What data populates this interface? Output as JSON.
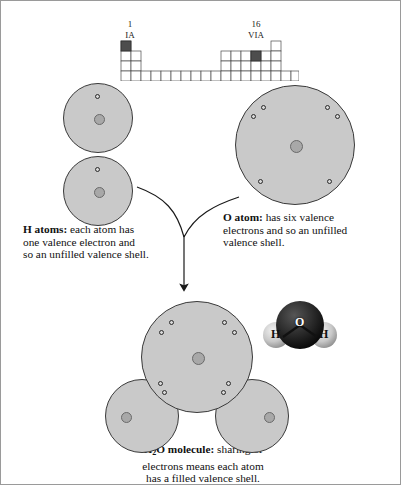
{
  "figure": {
    "background_color": "#ffffff",
    "border_color": "#9a9a9a"
  },
  "periodic_table": {
    "group_1": {
      "number": "1",
      "roman": "IA"
    },
    "group_16": {
      "number": "16",
      "roman": "VIA"
    },
    "highlight_color": "#4d4d4d",
    "cell_fill": "#ffffff",
    "cell_stroke": "#4a4a4a"
  },
  "atoms": {
    "hydrogen_1": {
      "label": "H",
      "valence_electrons": 1
    },
    "hydrogen_2": {
      "label": "H",
      "valence_electrons": 1
    },
    "oxygen": {
      "label": "O",
      "valence_electrons": 6
    },
    "shell_color": "#c9c9c9",
    "shell_stroke": "#3a3a3a",
    "nucleus_color": "#a8a8a8",
    "electron_color": "#d8d8d8",
    "electron_stroke": "#2a2a2a"
  },
  "captions": {
    "h_atoms": {
      "bold": "H atoms:",
      "line1": " each atom has",
      "line2": "one valence electron and",
      "line3": "so an unfilled valence shell."
    },
    "o_atom": {
      "bold": "O atom:",
      "line1": " has six valence",
      "line2": "electrons and so an unfilled",
      "line3": "valence shell."
    },
    "h2o_molecule": {
      "bold_pre": "H",
      "bold_sub": "2",
      "bold_post": "O molecule:",
      "line1": " sharing of",
      "line2": "electrons means each atom",
      "line3": "has a filled valence shell."
    }
  },
  "space_filling_model": {
    "oxygen_label": "O",
    "hydrogen_left_label": "H",
    "hydrogen_right_label": "H",
    "oxygen_color": "#262626",
    "hydrogen_color": "#cfcfcf"
  },
  "molecule": {
    "shared_pair_left": 2,
    "shared_pair_right": 2,
    "oxygen_lone_electrons": 4
  }
}
